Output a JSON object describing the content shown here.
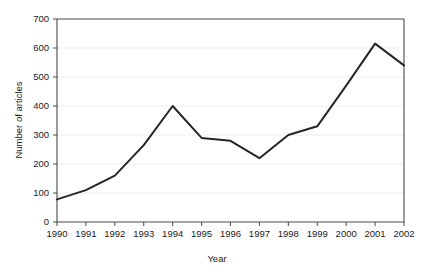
{
  "chart_data": {
    "type": "line",
    "title": "",
    "xlabel": "Year",
    "ylabel": "Number of articles",
    "categories": [
      1990,
      1991,
      1992,
      1993,
      1994,
      1995,
      1996,
      1997,
      1998,
      1999,
      2000,
      2001,
      2002
    ],
    "x_tick_labels": [
      "1990",
      "1991",
      "1992",
      "1993",
      "1994",
      "1995",
      "1996",
      "1997",
      "1998",
      "1999",
      "2000",
      "2001",
      "2002"
    ],
    "y_tick_labels": [
      "0",
      "100",
      "200",
      "300",
      "400",
      "500",
      "600",
      "700"
    ],
    "y_ticks": [
      0,
      100,
      200,
      300,
      400,
      500,
      600,
      700
    ],
    "values": [
      78,
      110,
      160,
      265,
      400,
      290,
      280,
      220,
      300,
      330,
      470,
      615,
      540
    ],
    "series": [
      {
        "name": "Number of articles",
        "values": [
          78,
          110,
          160,
          265,
          400,
          290,
          280,
          220,
          300,
          330,
          470,
          615,
          540
        ]
      }
    ],
    "xlim": [
      1990,
      2002
    ],
    "ylim": [
      0,
      700
    ],
    "grid": true,
    "grid_axis": "y",
    "legend": false,
    "legend_position": "none",
    "line_color": "#262626",
    "grid_color": "#e9e9e9",
    "axis_color": "#4a4a4a",
    "background_color": "#ffffff"
  }
}
